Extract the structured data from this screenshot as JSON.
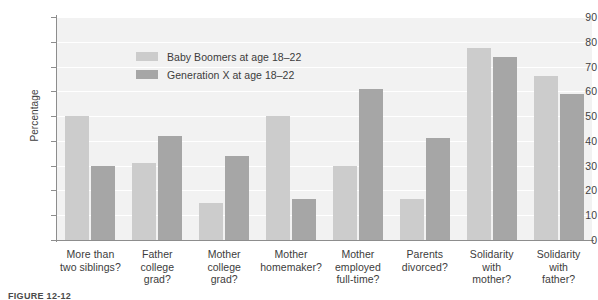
{
  "chart_data": {
    "type": "bar",
    "title": "",
    "xlabel": "",
    "ylabel": "Percentage",
    "ylim": [
      0,
      90
    ],
    "ytick_step": 10,
    "yticks": [
      90,
      80,
      70,
      60,
      50,
      40,
      30,
      20,
      10,
      0
    ],
    "grid": true,
    "grid_orientation": "horizontal",
    "legend_position": "upper-left-inside",
    "categories": [
      "More than two siblings?",
      "Father college grad?",
      "Mother college grad?",
      "Mother homemaker?",
      "Mother employed full-time?",
      "Parents divorced?",
      "Solidarity with mother?",
      "Solidarity with father?"
    ],
    "category_lines": [
      [
        "More than",
        "two siblings?"
      ],
      [
        "Father",
        "college",
        "grad?"
      ],
      [
        "Mother",
        "college",
        "grad?"
      ],
      [
        "Mother",
        "homemaker?"
      ],
      [
        "Mother",
        "employed",
        "full-time?"
      ],
      [
        "Parents",
        "divorced?"
      ],
      [
        "Solidarity",
        "with",
        "mother?"
      ],
      [
        "Solidarity",
        "with",
        "father?"
      ]
    ],
    "series": [
      {
        "name": "Baby Boomers at age 18–22",
        "color": "#cccccc",
        "values": [
          50,
          31,
          15,
          50,
          30,
          16.5,
          77.5,
          66
        ]
      },
      {
        "name": "Generation X at age 18–22",
        "color": "#a6a6a6",
        "values": [
          30,
          42,
          34,
          16.5,
          61,
          41,
          74,
          59
        ]
      }
    ]
  },
  "legend": {
    "items": [
      {
        "label": "Baby Boomers at age 18–22",
        "swatch": "s0"
      },
      {
        "label": "Generation X at age 18–22",
        "swatch": "s1"
      }
    ]
  },
  "axis": {
    "y_title": "Percentage"
  },
  "caption": {
    "figure_number": "FIGURE 12-12",
    "text": ""
  },
  "colors": {
    "series_light": "#cccccc",
    "series_dark": "#a6a6a6",
    "plot_background": "#f2f2f2",
    "gridline": "#ffffff",
    "axis": "#8d8d8d",
    "text": "#3c3c3c"
  }
}
